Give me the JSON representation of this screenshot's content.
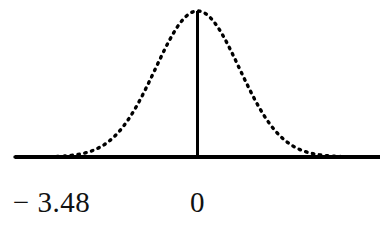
{
  "figure": {
    "kind": "normal-distribution-curve",
    "background_color": "#ffffff",
    "ink_color": "#000000"
  },
  "axis_labels": {
    "left_label": "− 3.48",
    "center_label": "0"
  },
  "chart_data": {
    "type": "area",
    "title": "",
    "subtitle": "",
    "xlabel": "",
    "ylabel": "",
    "grid": false,
    "legend": null,
    "curve_style": "dotted",
    "baseline_style": "solid",
    "xlim": [
      -4.35,
      4.35
    ],
    "ylim": [
      0,
      1
    ],
    "tick_values": [
      -3.48,
      0
    ],
    "tick_labels": [
      "− 3.48",
      "0"
    ],
    "distribution": {
      "name": "standard normal",
      "mean": 0,
      "sd": 1
    },
    "shaded_region": {
      "fill": "#000000",
      "from": -4.35,
      "to": -3.48,
      "boundary_line_at": -3.48,
      "description": "left tail shaded solid black up to z = -3.48"
    },
    "center_line": {
      "at": 0,
      "style": "solid",
      "from_y": 0,
      "to_y": 1
    },
    "x": [
      -4.35,
      -4.0,
      -3.75,
      -3.48,
      -3.2,
      -3.0,
      -2.75,
      -2.5,
      -2.25,
      -2.0,
      -1.75,
      -1.5,
      -1.25,
      -1.0,
      -0.75,
      -0.5,
      -0.25,
      0,
      0.25,
      0.5,
      0.75,
      1.0,
      1.25,
      1.5,
      1.75,
      2.0,
      2.25,
      2.5,
      2.75,
      3.0,
      3.2,
      3.48,
      3.75,
      4.0,
      4.35
    ],
    "y": [
      0.0,
      0.0,
      0.001,
      0.002,
      0.006,
      0.011,
      0.023,
      0.044,
      0.079,
      0.135,
      0.217,
      0.325,
      0.458,
      0.607,
      0.755,
      0.882,
      0.969,
      1.0,
      0.969,
      0.882,
      0.755,
      0.607,
      0.458,
      0.325,
      0.217,
      0.135,
      0.079,
      0.044,
      0.023,
      0.011,
      0.006,
      0.002,
      0.001,
      0.0,
      0.0
    ]
  }
}
